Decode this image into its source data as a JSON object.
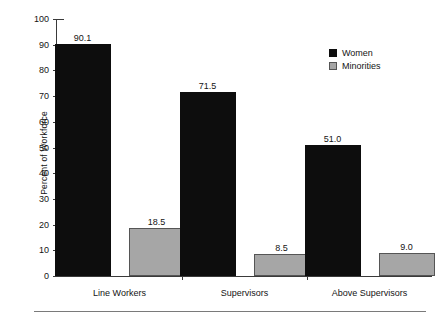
{
  "chart_data": {
    "type": "bar",
    "title": "",
    "xlabel": "",
    "ylabel": "Percent of Workforce",
    "ylim": [
      0,
      100
    ],
    "ytick_step": 10,
    "yticks": [
      "100",
      "90",
      "80",
      "70",
      "60",
      "50",
      "40",
      "30",
      "20",
      "10",
      "0"
    ],
    "grid": false,
    "legend_position": "top-right",
    "categories": [
      "Line Workers",
      "Supervisors",
      "Above Supervisors"
    ],
    "series": [
      {
        "name": "Women",
        "color": "#0d0d0d",
        "values": [
          90.1,
          71.5,
          51.0
        ],
        "labels": [
          "90.1",
          "71.5",
          "51.0"
        ]
      },
      {
        "name": "Minorities",
        "color": "#a6a6a6",
        "values": [
          18.5,
          8.5,
          9.0
        ],
        "labels": [
          "18.5",
          "8.5",
          "9.0"
        ]
      }
    ]
  },
  "legend": {
    "items": [
      {
        "label": "Women",
        "swatch": "black-square-swatch"
      },
      {
        "label": "Minorities",
        "swatch": "gray-square-swatch"
      }
    ]
  }
}
